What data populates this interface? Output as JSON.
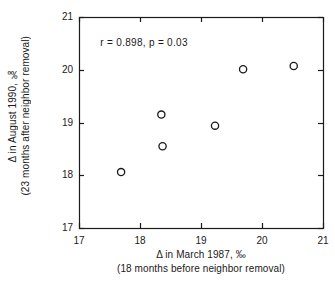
{
  "chart_data": {
    "type": "scatter",
    "title": "",
    "xlabel": "Δ in March 1987, ‰",
    "xlabel_line2": "(18 months before neighbor removal)",
    "ylabel": "Δ in August 1990, ‰",
    "ylabel_line2": "(23 months after neighbor removal)",
    "xlim": [
      17,
      21
    ],
    "ylim": [
      17,
      21
    ],
    "xticks": [
      "17",
      "18",
      "19",
      "20",
      "21"
    ],
    "yticks": [
      "17",
      "18",
      "19",
      "20",
      "21"
    ],
    "xtick_values": [
      17,
      18,
      19,
      20,
      21
    ],
    "ytick_values": [
      17,
      18,
      19,
      20,
      21
    ],
    "grid": false,
    "legend": false,
    "marker": "open-circle",
    "marker_color": "#1a1a1a",
    "points": [
      {
        "x": 17.69,
        "y": 18.06
      },
      {
        "x": 18.35,
        "y": 19.15
      },
      {
        "x": 18.37,
        "y": 18.55
      },
      {
        "x": 19.23,
        "y": 18.94
      },
      {
        "x": 19.69,
        "y": 20.01
      },
      {
        "x": 20.52,
        "y": 20.07
      }
    ],
    "annotations": [
      {
        "text": "r  =  0.898,  p  =  0.03",
        "x": 17.35,
        "y": 20.62
      }
    ]
  }
}
